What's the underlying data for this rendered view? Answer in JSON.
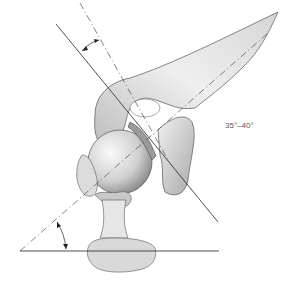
{
  "figure": {
    "type": "anatomical-illustration",
    "angle_label": "35°–40°",
    "annotations": {
      "upper_angle": "angle between glenoid face line and scapular reference line",
      "lower_angle": "angle between scapular axis (dashed) and horizontal"
    },
    "colors": {
      "line": "#222222",
      "bone_light": "#f2f2f2",
      "bone_mid": "#c9c9c9",
      "bone_dark": "#8a8a8a"
    }
  }
}
